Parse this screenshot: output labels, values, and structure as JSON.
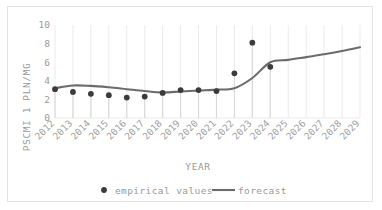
{
  "chart_data": {
    "type": "line",
    "title": "",
    "xlabel": "YEAR",
    "ylabel": "PSCMI 1 PLN/MG",
    "x": [
      2012,
      2013,
      2014,
      2015,
      2016,
      2017,
      2018,
      2019,
      2020,
      2021,
      2022,
      2023,
      2024,
      2025,
      2026,
      2027,
      2028,
      2029
    ],
    "categories": [
      "2012",
      "2013",
      "2014",
      "2015",
      "2016",
      "2017",
      "2018",
      "2019",
      "2020",
      "2021",
      "2022",
      "2023",
      "2024",
      "2025",
      "2026",
      "2027",
      "2028",
      "2029"
    ],
    "ylim": [
      0,
      10
    ],
    "yticks": [
      0,
      2,
      4,
      6,
      8,
      10
    ],
    "ytick_labels": [
      "0",
      "2",
      "4",
      "6",
      "8",
      "10"
    ],
    "grid": "vertical",
    "legend_position": "bottom",
    "series": [
      {
        "name": "empirical values",
        "type": "scatter",
        "marker": "circle",
        "color": "#3b3b3b",
        "has_drop_lines": true,
        "x": [
          2012,
          2013,
          2014,
          2015,
          2016,
          2017,
          2018,
          2019,
          2020,
          2021,
          2022,
          2023,
          2024
        ],
        "values": [
          3.1,
          2.8,
          2.6,
          2.45,
          2.2,
          2.3,
          2.7,
          3.0,
          3.0,
          2.9,
          4.8,
          8.1,
          5.5
        ]
      },
      {
        "name": "forecast",
        "type": "line",
        "color": "#6b6b6b",
        "x": [
          2012,
          2013,
          2014,
          2015,
          2016,
          2017,
          2018,
          2019,
          2020,
          2021,
          2022,
          2023,
          2024,
          2025,
          2026,
          2027,
          2028,
          2029
        ],
        "values": [
          3.2,
          3.5,
          3.45,
          3.3,
          3.1,
          2.9,
          2.75,
          2.85,
          2.95,
          3.05,
          3.2,
          4.3,
          6.0,
          6.25,
          6.55,
          6.85,
          7.2,
          7.6
        ]
      }
    ]
  },
  "axes": {
    "y_title": "PSCMI 1 PLN/MG",
    "x_title": "YEAR"
  },
  "legend": {
    "items": [
      {
        "label": "empirical values",
        "marker": "dot-marker",
        "color": "#3b3b3b"
      },
      {
        "label": "forecast",
        "marker": "line-marker",
        "color": "#6b6b6b"
      }
    ]
  },
  "colors": {
    "empirical": "#3b3b3b",
    "forecast": "#6b6b6b",
    "gridline": "#ebebeb",
    "dropline": "#d8d8d8",
    "axis_text": "#9a9a9a",
    "frame": "#e3e3e3",
    "background": "#ffffff"
  }
}
